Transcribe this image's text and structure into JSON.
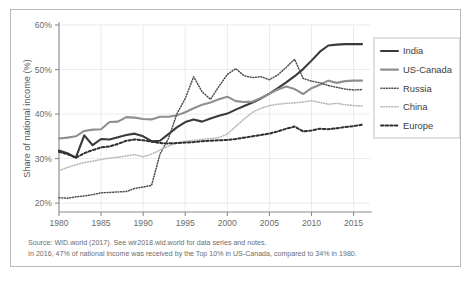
{
  "figure": {
    "border_color": "#b9b9b9",
    "background": "#ffffff"
  },
  "footnotes": {
    "source_line": "Source: WID.world (2017). See wir2018.wid.world for data series and notes.",
    "note_line": "In 2016, 47% of national income was received by the Top 10% in US-Canada, compared to 34% in 1980."
  },
  "chart_data": {
    "type": "line",
    "title": "",
    "xlabel": "",
    "ylabel": "Share of national income (%)",
    "xlim": [
      1980,
      2016
    ],
    "ylim": [
      18,
      60
    ],
    "grid": true,
    "grid_color": "#e3e3e3",
    "axis_color": "#8c8c8c",
    "legend_position": "right",
    "ytick_labels": [
      "20%",
      "30%",
      "40%",
      "50%",
      "60%"
    ],
    "ytick_values": [
      20,
      30,
      40,
      50,
      60
    ],
    "xtick_labels": [
      "1980",
      "1985",
      "1990",
      "1995",
      "2000",
      "2005",
      "2010",
      "2015"
    ],
    "xtick_values": [
      1980,
      1985,
      1990,
      1995,
      2000,
      2005,
      2010,
      2015
    ],
    "x": [
      1980,
      1981,
      1982,
      1983,
      1984,
      1985,
      1986,
      1987,
      1988,
      1989,
      1990,
      1991,
      1992,
      1993,
      1994,
      1995,
      1996,
      1997,
      1998,
      1999,
      2000,
      2001,
      2002,
      2003,
      2004,
      2005,
      2006,
      2007,
      2008,
      2009,
      2010,
      2011,
      2012,
      2013,
      2014,
      2015,
      2016
    ],
    "series": [
      {
        "name": "India",
        "color": "#3a3a3a",
        "style": "solid",
        "width": 2.1,
        "values": [
          31.8,
          31.2,
          30.2,
          35.2,
          33.0,
          34.4,
          34.3,
          34.8,
          35.3,
          35.6,
          35.0,
          33.9,
          34.0,
          35.5,
          37.0,
          38.2,
          38.8,
          38.3,
          39.0,
          39.6,
          40.1,
          41.0,
          41.8,
          42.6,
          43.5,
          44.6,
          45.8,
          47.1,
          48.5,
          50.1,
          52.0,
          54.0,
          55.4,
          55.6,
          55.7,
          55.7,
          55.7
        ]
      },
      {
        "name": "US-Canada",
        "color": "#8f8f8f",
        "style": "solid",
        "width": 2.1,
        "values": [
          34.5,
          34.7,
          35.0,
          36.2,
          36.5,
          36.6,
          38.2,
          38.3,
          39.3,
          39.2,
          38.9,
          38.8,
          39.4,
          39.4,
          39.7,
          40.4,
          41.3,
          42.1,
          42.6,
          43.3,
          43.9,
          42.9,
          42.7,
          42.8,
          43.6,
          44.6,
          45.5,
          46.2,
          45.6,
          44.5,
          45.8,
          46.6,
          47.5,
          47.0,
          47.4,
          47.5,
          47.5
        ]
      },
      {
        "name": "Russia",
        "color": "#4d4d4d",
        "style": "dotted-fine",
        "width": 1.5,
        "values": [
          21.2,
          21.1,
          21.4,
          21.6,
          21.9,
          22.3,
          22.4,
          22.5,
          22.6,
          23.3,
          23.6,
          24.0,
          31.0,
          34.5,
          40.0,
          43.5,
          48.4,
          45.0,
          43.3,
          46.2,
          48.9,
          50.2,
          48.6,
          48.2,
          48.4,
          47.7,
          48.8,
          50.5,
          52.3,
          48.0,
          47.4,
          47.0,
          46.4,
          46.0,
          45.6,
          45.4,
          45.5
        ]
      },
      {
        "name": "China",
        "color": "#b4b4b4",
        "style": "dotted-fine",
        "width": 1.5,
        "values": [
          27.3,
          28.0,
          28.6,
          29.1,
          29.4,
          29.8,
          30.1,
          30.3,
          30.6,
          30.9,
          30.4,
          31.0,
          31.9,
          32.8,
          33.5,
          33.9,
          34.1,
          34.3,
          34.5,
          34.7,
          35.5,
          37.2,
          38.9,
          40.4,
          41.3,
          41.9,
          42.2,
          42.4,
          42.5,
          42.7,
          43.0,
          42.6,
          42.2,
          42.4,
          42.1,
          41.9,
          41.8
        ]
      },
      {
        "name": "Europe",
        "color": "#2f2f2f",
        "style": "dotted-bold",
        "width": 2.0,
        "values": [
          31.5,
          31.0,
          30.2,
          31.2,
          31.9,
          32.5,
          32.7,
          33.3,
          34.0,
          34.3,
          34.1,
          33.8,
          33.5,
          33.4,
          33.5,
          33.6,
          33.7,
          33.9,
          34.0,
          34.1,
          34.2,
          34.4,
          34.7,
          35.0,
          35.3,
          35.6,
          36.1,
          36.7,
          37.2,
          36.1,
          36.3,
          36.7,
          36.6,
          36.8,
          37.1,
          37.3,
          37.6
        ]
      }
    ]
  }
}
